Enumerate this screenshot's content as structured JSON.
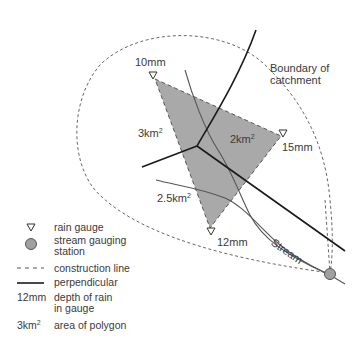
{
  "diagram": {
    "type": "thiessen-polygon-catchment",
    "labels": {
      "boundary": "Boundary of catchment",
      "boundary_line1": "Boundary of",
      "boundary_line2": "catchment",
      "stream": "Stream"
    },
    "gauges": [
      {
        "depth": "10mm",
        "x": 153,
        "y": 77
      },
      {
        "depth": "15mm",
        "x": 283,
        "y": 134
      },
      {
        "depth": "12mm",
        "x": 211,
        "y": 231
      }
    ],
    "areas": [
      {
        "value": "3km",
        "sup": "2"
      },
      {
        "value": "2km",
        "sup": "2"
      },
      {
        "value": "2.5km",
        "sup": "2"
      }
    ],
    "colors": {
      "polygon_fill": "#a9a9a9",
      "station_fill": "#a0a0a0",
      "line": "#1a1a1a",
      "stream": "#555555",
      "dash": "#555555"
    }
  },
  "legend": {
    "items": [
      {
        "symbol": "triangle-outline",
        "label": "rain gauge"
      },
      {
        "symbol": "grey-circle",
        "label": "stream gauging station"
      },
      {
        "symbol": "dashed-line",
        "label": "construction line"
      },
      {
        "symbol": "solid-line",
        "label": "perpendicular"
      },
      {
        "symbol_text": "12mm",
        "label": "depth of rain in gauge"
      },
      {
        "symbol_text": "3km",
        "symbol_sup": "2",
        "label": "area of polygon"
      }
    ]
  }
}
